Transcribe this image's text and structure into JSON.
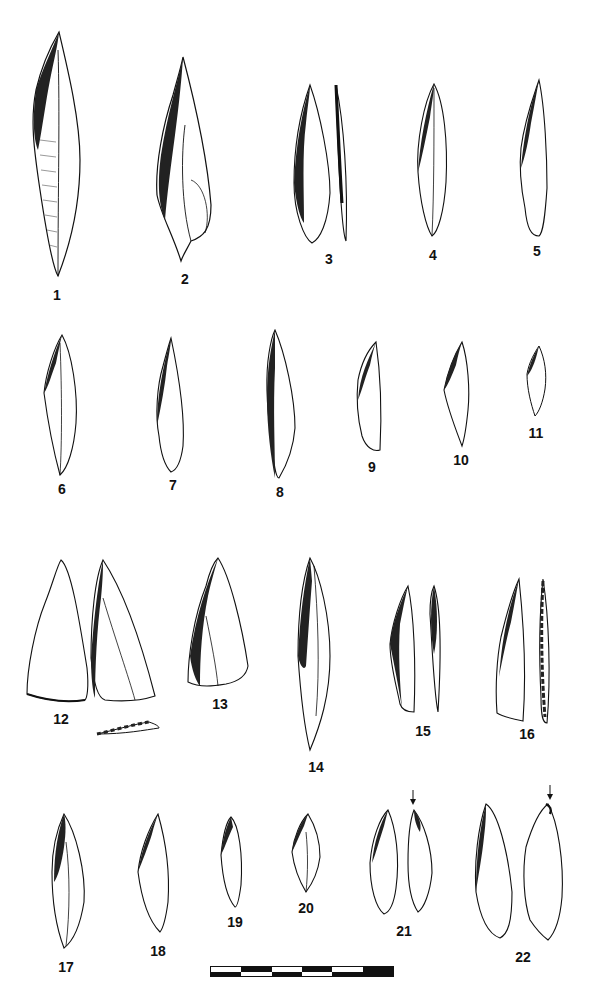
{
  "figure": {
    "type": "lithic-illustration-plate",
    "ink_color": "#111111",
    "background": "#ffffff",
    "artifacts": [
      {
        "number": "1",
        "views": 1,
        "row": 1
      },
      {
        "number": "2",
        "views": 1,
        "row": 1
      },
      {
        "number": "3",
        "views": 2,
        "row": 1
      },
      {
        "number": "4",
        "views": 1,
        "row": 1
      },
      {
        "number": "5",
        "views": 1,
        "row": 1
      },
      {
        "number": "6",
        "views": 1,
        "row": 2
      },
      {
        "number": "7",
        "views": 1,
        "row": 2
      },
      {
        "number": "8",
        "views": 1,
        "row": 2
      },
      {
        "number": "9",
        "views": 1,
        "row": 2
      },
      {
        "number": "10",
        "views": 1,
        "row": 2
      },
      {
        "number": "11",
        "views": 1,
        "row": 2
      },
      {
        "number": "12",
        "views": 3,
        "row": 3
      },
      {
        "number": "13",
        "views": 1,
        "row": 3
      },
      {
        "number": "14",
        "views": 1,
        "row": 3
      },
      {
        "number": "15",
        "views": 2,
        "row": 3
      },
      {
        "number": "16",
        "views": 2,
        "row": 3
      },
      {
        "number": "17",
        "views": 1,
        "row": 4
      },
      {
        "number": "18",
        "views": 1,
        "row": 4
      },
      {
        "number": "19",
        "views": 1,
        "row": 4
      },
      {
        "number": "20",
        "views": 1,
        "row": 4
      },
      {
        "number": "21",
        "views": 2,
        "row": 4,
        "arrow_marker": true
      },
      {
        "number": "22",
        "views": 2,
        "row": 4,
        "arrow_marker": true
      }
    ],
    "scale_bar": {
      "segments": 5,
      "pattern": "alternating-black-white-checker"
    }
  }
}
